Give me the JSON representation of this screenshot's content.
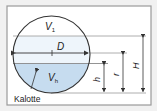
{
  "diagram": {
    "labels": {
      "upper_volume": "V",
      "upper_volume_sub": "1",
      "lower_volume": "V",
      "lower_volume_sub": "h",
      "diameter": "D",
      "fill_height": "h",
      "radius": "r",
      "total_height": "H",
      "cap": "Kalotte"
    },
    "colors": {
      "frame": "#9a9a9a",
      "background": "#f1f1f1",
      "panel": "#ffffff",
      "liquid": "#c6dcef",
      "band": "#eef5fb",
      "stroke": "#333333",
      "dimension": "#555555"
    }
  }
}
